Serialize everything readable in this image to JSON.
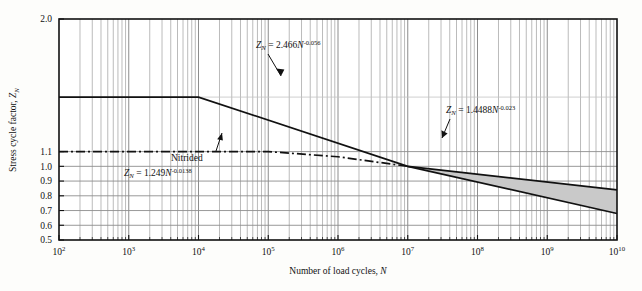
{
  "chart_data": {
    "type": "line",
    "title": "",
    "xlabel": "Number of load cycles, N",
    "ylabel": "Stress cycle factor, Z_N",
    "xscale": "log",
    "yscale": "linear",
    "xlim": [
      100,
      10000000000
    ],
    "ylim": [
      0.5,
      2.0
    ],
    "grid": true,
    "grid_minor": true,
    "legend": "none",
    "x_tick_labels": [
      "10^2",
      "10^3",
      "10^4",
      "10^5",
      "10^6",
      "10^7",
      "10^8",
      "10^9",
      "10^10"
    ],
    "x_tick_mantissa": [
      "10",
      "10",
      "10",
      "10",
      "10",
      "10",
      "10",
      "10",
      "10"
    ],
    "x_tick_exponents": [
      "2",
      "3",
      "4",
      "5",
      "6",
      "7",
      "8",
      "9",
      "10"
    ],
    "y_tick_labels": [
      "2.0",
      "1.1",
      "1.0",
      "0.9",
      "0.8",
      "0.7",
      "0.6",
      "0.5"
    ],
    "y_tick_values": [
      2.0,
      1.1,
      1.0,
      0.9,
      0.8,
      0.7,
      0.6,
      0.5
    ],
    "series": [
      {
        "name": "upper-bound",
        "equation": "Z_N = 2.466 N^-0.056",
        "coefficient": 2.466,
        "exponent": -0.056,
        "style": "solid",
        "plateau_value": 1.47,
        "plateau_until_x": 10000,
        "points": [
          {
            "x": 100,
            "y": 1.47
          },
          {
            "x": 10000,
            "y": 1.47
          },
          {
            "x": 100000,
            "y": 1.29
          },
          {
            "x": 1000000,
            "y": 1.14
          },
          {
            "x": 10000000,
            "y": 1.0
          },
          {
            "x": 100000000,
            "y": 0.88
          },
          {
            "x": 1000000000,
            "y": 0.775
          },
          {
            "x": 10000000000,
            "y": 0.84
          }
        ]
      },
      {
        "name": "lower-bound",
        "equation": "Z_N = 1.4488 N^-0.023",
        "coefficient": 1.4488,
        "exponent": -0.023,
        "style": "solid",
        "points": [
          {
            "x": 10000000,
            "y": 1.0
          },
          {
            "x": 10000000000,
            "y": 0.68
          }
        ]
      },
      {
        "name": "nitrided",
        "equation": "Z_N = 1.249 N^-0.0138",
        "coefficient": 1.249,
        "exponent": -0.0138,
        "style": "dash-dot",
        "plateau_value": 1.1,
        "plateau_until_x": 100000,
        "points": [
          {
            "x": 100,
            "y": 1.1
          },
          {
            "x": 100000,
            "y": 1.1
          },
          {
            "x": 1000000,
            "y": 1.065
          },
          {
            "x": 10000000,
            "y": 1.0
          }
        ]
      }
    ],
    "shaded_region": {
      "name": "scatter-band",
      "fill_color": "#c9c9c9",
      "between": [
        "upper-bound",
        "lower-bound"
      ],
      "x_start": 10000000,
      "x_end": 10000000000
    },
    "annotations": [
      {
        "id": "upper-equation",
        "text": "Z_N = 2.466N^-0.056",
        "prefix": "Z",
        "sub": "N",
        "mid": " = 2.466",
        "var": "N",
        "sup": "-0.056",
        "arrow": true
      },
      {
        "id": "lower-equation",
        "text": "Z_N = 1.4488N^-0.023",
        "prefix": "Z",
        "sub": "N",
        "mid": " = 1.4488",
        "var": "N",
        "sup": "-0.023",
        "arrow": true
      },
      {
        "id": "nitrided-label",
        "text": "Nitrided",
        "arrow": true
      },
      {
        "id": "nitrided-equation",
        "text": "Z_N = 1.249N^-0.0138",
        "prefix": "Z",
        "sub": "N",
        "mid": " = 1.249",
        "var": "N",
        "sup": "-0.0138",
        "arrow": false
      }
    ],
    "colors": {
      "line": "#111111",
      "grid": "#8d8d8d",
      "grid_minor": "#9e9e9e",
      "shade": "#c9c9c9",
      "background": "#fdfdfb",
      "frame": "#111111"
    }
  },
  "axes": {
    "x_title": "Number of load cycles, N",
    "x_title_plain": "Number of load cycles, ",
    "x_title_italic": "N",
    "y_title_plain": "Stress cycle factor, ",
    "y_title_italic": "Z",
    "y_title_sub": "N"
  }
}
